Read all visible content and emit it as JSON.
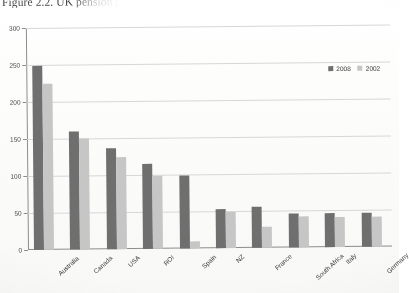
{
  "caption": {
    "text": "Figure 2.2. UK pension p"
  },
  "legend": {
    "position": "top-right",
    "items": [
      {
        "label": "2008",
        "color": "#6f6f6f"
      },
      {
        "label": "2002",
        "color": "#c6c6c6"
      }
    ]
  },
  "axis": {
    "y_ticks": [
      "0",
      "50",
      "100",
      "150",
      "200",
      "250",
      "300"
    ]
  },
  "chart_data": {
    "type": "bar",
    "title": "Figure 2.2. UK pension p",
    "xlabel": "",
    "ylabel": "",
    "ylim": [
      0,
      300
    ],
    "grid": true,
    "legend_position": "top-right",
    "categories": [
      "Australia",
      "Canada",
      "USA",
      "ROI",
      "Spain",
      "NZ",
      "France",
      "South Africa",
      "Italy",
      "Germany"
    ],
    "series": [
      {
        "name": "2008",
        "color": "#6f6f6f",
        "values": [
          248,
          160,
          137,
          115,
          98,
          53,
          55,
          46,
          46,
          46
        ]
      },
      {
        "name": "2002",
        "color": "#c6c6c6",
        "values": [
          225,
          150,
          125,
          98,
          10,
          48,
          28,
          42,
          40,
          40
        ]
      }
    ]
  }
}
